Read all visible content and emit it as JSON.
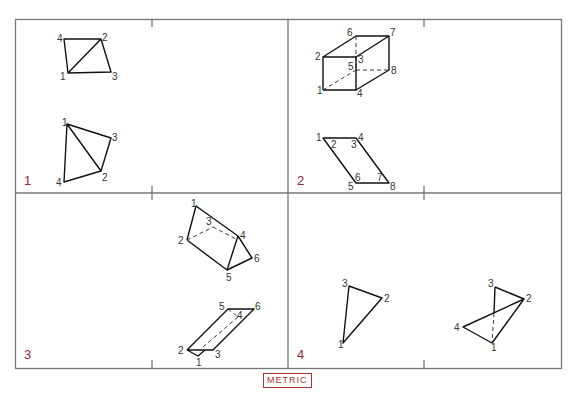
{
  "figure": {
    "badge": "METRIC",
    "panels": [
      {
        "number": "1",
        "views": [
          {
            "labels": [
              "1",
              "2",
              "3",
              "4"
            ]
          },
          {
            "labels": [
              "1",
              "2",
              "3",
              "4"
            ]
          }
        ]
      },
      {
        "number": "2",
        "views": [
          {
            "labels": [
              "1",
              "2",
              "3",
              "4",
              "5",
              "6",
              "7",
              "8"
            ]
          },
          {
            "labels": [
              "1",
              "2",
              "3",
              "4",
              "5",
              "6",
              "7",
              "8"
            ]
          }
        ]
      },
      {
        "number": "3",
        "views": [
          {
            "labels": [
              "1",
              "2",
              "3",
              "4",
              "5",
              "6"
            ]
          },
          {
            "labels": [
              "1",
              "2",
              "3",
              "4",
              "5",
              "6"
            ]
          }
        ]
      },
      {
        "number": "4",
        "views": [
          {
            "labels": [
              "1",
              "2",
              "3"
            ]
          },
          {
            "labels": [
              "1",
              "2",
              "3",
              "4"
            ]
          }
        ]
      }
    ],
    "colors": {
      "frame": "#777777",
      "line": "#111111",
      "panel_number": "#8b2a3a",
      "badge": "#aa3333"
    }
  }
}
